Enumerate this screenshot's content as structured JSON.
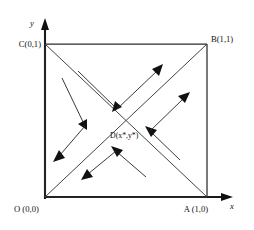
{
  "figure": {
    "axes": {
      "x_label": "x",
      "y_label": "y"
    },
    "colors": {
      "axis": "#1a1a1a",
      "square": "#2b2b2b",
      "diagonal": "#3a3a3a",
      "arrow": "#2e2e2e",
      "background": "#ffffff"
    },
    "vertices": [
      {
        "key": "O",
        "label": "O (0,0)",
        "point": "(0,0)",
        "corner": "bottom-left"
      },
      {
        "key": "A",
        "label": "A (1,0)",
        "point": "(1,0)",
        "corner": "bottom-right"
      },
      {
        "key": "B",
        "label": "B(1,1)",
        "point": "(1,1)",
        "corner": "top-right"
      },
      {
        "key": "C",
        "label": "C(0,1)",
        "point": "(0,1)",
        "corner": "top-left"
      }
    ],
    "interior_point": {
      "key": "D",
      "label": "D(x*,y*)",
      "description": "interior equilibrium at diagonal intersection"
    },
    "diagonals": [
      {
        "from": "O",
        "to": "B"
      },
      {
        "from": "C",
        "to": "A"
      }
    ],
    "flow_chevrons": [
      {
        "id": "top",
        "inbound_direction": "down-right",
        "outbound_direction": "up-right"
      },
      {
        "id": "left",
        "inbound_direction": "down-right",
        "outbound_direction": "down-left"
      },
      {
        "id": "bottom",
        "inbound_direction": "up-left",
        "outbound_direction": "down-left"
      },
      {
        "id": "right",
        "inbound_direction": "up-left",
        "outbound_direction": "up-right"
      }
    ]
  }
}
